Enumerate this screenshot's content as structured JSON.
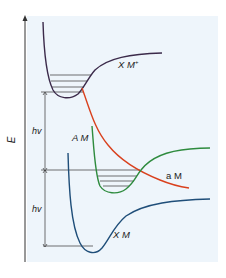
{
  "diagram": {
    "type": "potential-energy-curves",
    "axis": {
      "label": "E"
    },
    "colors": {
      "panel_bg": "#eef5fb",
      "axis": "#333333",
      "xm_plus": "#3b2a4a",
      "am": "#2e8b3e",
      "a_m": "#d9411e",
      "xm": "#1f4e79",
      "levels": "#333333"
    },
    "curves": [
      {
        "id": "xm_plus",
        "label": "X M",
        "superscript": "+"
      },
      {
        "id": "am",
        "label": "A M"
      },
      {
        "id": "a_m",
        "label": "a M"
      },
      {
        "id": "xm",
        "label": "X M"
      }
    ],
    "transitions": [
      {
        "label": "hv"
      },
      {
        "label": "hv"
      }
    ]
  }
}
